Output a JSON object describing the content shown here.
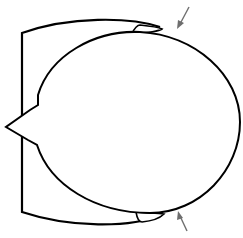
{
  "diagram": {
    "colors": {
      "stroke": "#000000",
      "arrow": "#6e6e6e",
      "background": "#ffffff"
    },
    "arrows": [
      {
        "position": "top-right",
        "direction": "down-left"
      },
      {
        "position": "bottom-right",
        "direction": "up-left"
      }
    ]
  }
}
